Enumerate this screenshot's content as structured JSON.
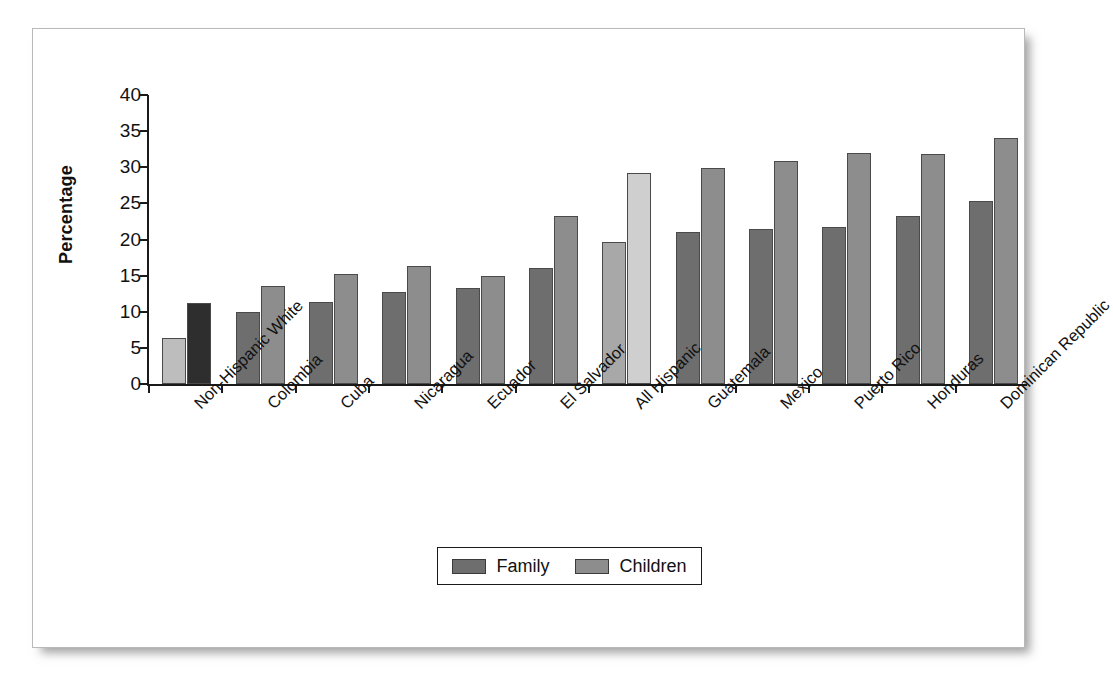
{
  "chart_data": {
    "type": "bar",
    "title": "",
    "xlabel": "",
    "ylabel": "Percentage",
    "ylim": [
      0,
      40
    ],
    "yticks": [
      0,
      5,
      10,
      15,
      20,
      25,
      30,
      35,
      40
    ],
    "grid": false,
    "legend_position": "bottom-center",
    "categories": [
      "Non-Hispanic White",
      "Colombia",
      "Cuba",
      "Nicaragua",
      "Ecuador",
      "El Salvador",
      "All Hispanic",
      "Guatemala",
      "Mexico",
      "Puerto Rico",
      "Honduras",
      "Dominican Republic"
    ],
    "series": [
      {
        "name": "Family",
        "color": "#6e6e6e",
        "values": [
          6.3,
          10.0,
          11.4,
          12.7,
          13.3,
          16.0,
          19.7,
          21.0,
          21.4,
          21.7,
          23.2,
          25.3
        ]
      },
      {
        "name": "Children",
        "color": "#8d8d8d",
        "values": [
          11.2,
          13.6,
          15.2,
          16.3,
          15.0,
          23.2,
          29.2,
          29.9,
          30.8,
          32.0,
          31.9,
          34.0
        ]
      }
    ],
    "highlight_groups": [
      {
        "index": 0,
        "family_color": "#bdbdbd",
        "children_color": "#2e2e2e"
      },
      {
        "index": 6,
        "family_color": "#a8a8a8",
        "children_color": "#cfcfcf"
      }
    ]
  },
  "legend": {
    "entries": [
      {
        "label": "Family",
        "color": "#6e6e6e"
      },
      {
        "label": "Children",
        "color": "#8d8d8d"
      }
    ]
  }
}
